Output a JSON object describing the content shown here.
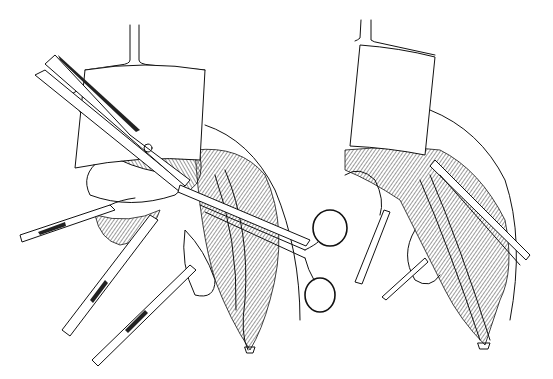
{
  "figure": {
    "type": "surgical line illustration",
    "panels": [
      {
        "id": "left-panel",
        "elements": [
          "retractor",
          "scissors",
          "forceps-1",
          "forceps-2",
          "forceps-3",
          "ring-handled-clamp",
          "incision",
          "surgeon-hand"
        ]
      },
      {
        "id": "right-panel",
        "elements": [
          "retractor",
          "forceps-1",
          "forceps-2",
          "dissecting-instrument",
          "incision"
        ]
      }
    ],
    "colors": {
      "line": "#111111",
      "background": "#ffffff"
    }
  }
}
